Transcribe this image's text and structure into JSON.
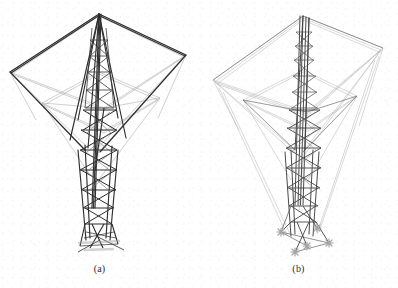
{
  "figure": {
    "background_color": "#ffffff",
    "caption_color": "#2b2b2b",
    "panel_count": 2
  },
  "panels": [
    {
      "id": "a",
      "caption": "(a)",
      "subject": "lattice transmission tower wireframe, dark heavy stroke rendering",
      "stroke_color": "#2e2e2e",
      "light_stroke_color": "#8f8f8f",
      "line_weight": "heavy",
      "apex": {
        "x": 99,
        "y": 14
      },
      "top_rim": {
        "left": {
          "x": 10,
          "y": 72
        },
        "right": {
          "x": 186,
          "y": 55
        },
        "front": {
          "x": 104,
          "y": 108
        },
        "back": {
          "x": 99,
          "y": 14
        }
      },
      "mid_rim": {
        "y": 103,
        "left_x": 42,
        "right_x": 160
      },
      "waist": {
        "x": 88,
        "y": 148
      },
      "base": {
        "x": 98,
        "y": 243
      },
      "mast_top": {
        "x": 99,
        "y": 16
      },
      "bracing_bays": 8,
      "leg_count": 4,
      "has_foundation_markers": false
    },
    {
      "id": "b",
      "caption": "(b)",
      "subject": "lattice transmission tower wireframe, light thin stroke rendering with foundation markers",
      "stroke_color": "#4a4a4a",
      "light_stroke_color": "#b0b0b0",
      "line_weight": "light",
      "apex": {
        "x": 104,
        "y": 16
      },
      "top_rim": {
        "left": {
          "x": 14,
          "y": 80
        },
        "right": {
          "x": 184,
          "y": 48
        },
        "front": {
          "x": 108,
          "y": 112
        },
        "back": {
          "x": 104,
          "y": 16
        }
      },
      "mid_rim": {
        "y": 100,
        "left_x": 44,
        "right_x": 158
      },
      "waist": {
        "x": 96,
        "y": 150
      },
      "base": {
        "x": 100,
        "y": 240
      },
      "mast_top": {
        "x": 110,
        "y": 18
      },
      "bracing_bays": 9,
      "leg_count": 4,
      "has_foundation_markers": true,
      "foundation_markers": [
        {
          "x": 82,
          "y": 232
        },
        {
          "x": 118,
          "y": 228
        },
        {
          "x": 96,
          "y": 252
        },
        {
          "x": 130,
          "y": 243
        },
        {
          "x": 108,
          "y": 246
        }
      ]
    }
  ]
}
